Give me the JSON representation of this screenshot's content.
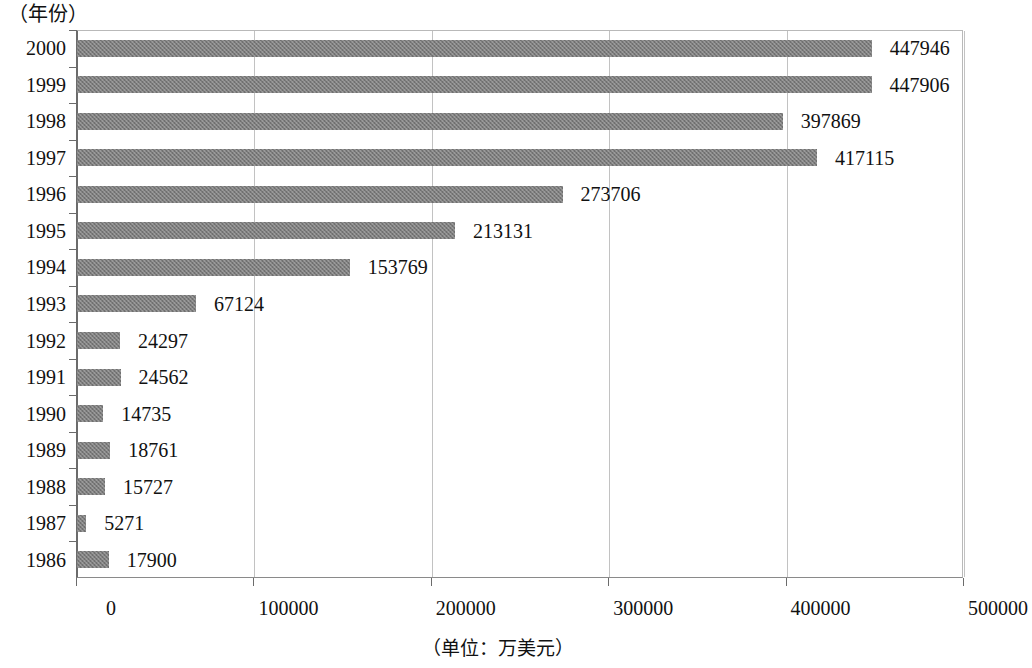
{
  "chart_data": {
    "type": "bar",
    "orientation": "horizontal",
    "title": "",
    "subtitle": "",
    "ylabel": "（年份）",
    "xlabel": "（单位：万美元）",
    "categories": [
      "2000",
      "1999",
      "1998",
      "1997",
      "1996",
      "1995",
      "1994",
      "1993",
      "1992",
      "1991",
      "1990",
      "1989",
      "1988",
      "1987",
      "1986"
    ],
    "values": [
      447946,
      447906,
      397869,
      417115,
      273706,
      213131,
      153769,
      67124,
      24297,
      24562,
      14735,
      18761,
      15727,
      5271,
      17900
    ],
    "data_labels": [
      "447946",
      "447906",
      "397869",
      "417115",
      "273706",
      "213131",
      "153769",
      "67124",
      "24297",
      "24562",
      "14735",
      "18761",
      "15727",
      "5271",
      "17900"
    ],
    "xlim": [
      0,
      500000
    ],
    "xticks": [
      0,
      100000,
      200000,
      300000,
      400000,
      500000
    ],
    "xtick_labels": [
      "0",
      "100000",
      "200000",
      "300000",
      "400000",
      "500000"
    ],
    "grid": true,
    "grid_axis": "x",
    "legend": "none",
    "bar_color": "#7d7d7d",
    "series_name": ""
  },
  "axes": {
    "y_heading": "（年份）",
    "x_title": "（单位：万美元）"
  }
}
